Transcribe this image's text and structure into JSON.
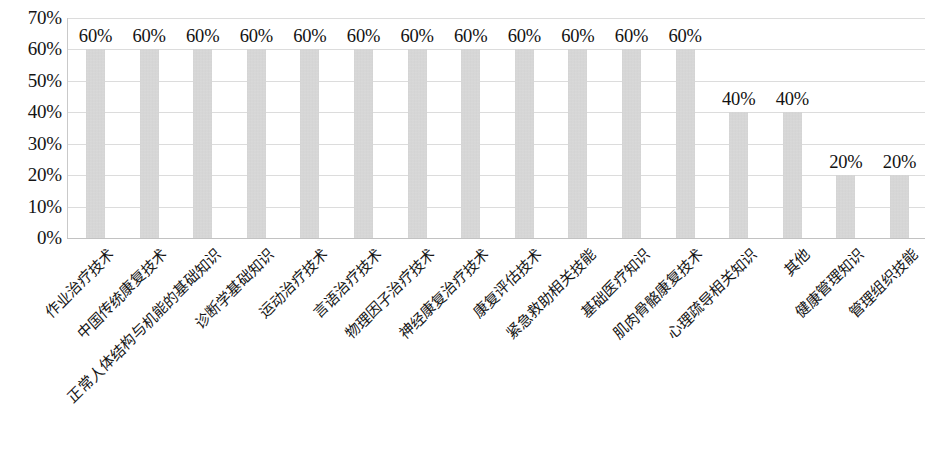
{
  "chart_data": {
    "type": "bar",
    "title": "",
    "subtitle": "",
    "xlabel": "",
    "ylabel": "",
    "ylim": [
      0,
      70
    ],
    "y_tick_labels": [
      "70%",
      "60%",
      "50%",
      "40%",
      "30%",
      "20%",
      "10%",
      "0%"
    ],
    "y_tick_values": [
      70,
      60,
      50,
      40,
      30,
      20,
      10,
      0
    ],
    "grid": true,
    "legend": "none",
    "value_suffix": "%",
    "categories": [
      "作业治疗技术",
      "中国传统康复技术",
      "正常人体结构与机能的基础知识",
      "诊断学基础知识",
      "运动治疗技术",
      "言语治疗技术",
      "物理因子治疗技术",
      "神经康复治疗技术",
      "康复评估技术",
      "紧急救助相关技能",
      "基础医疗知识",
      "肌肉骨骼康复技术",
      "心理疏导相关知识",
      "其他",
      "健康管理知识",
      "管理组织技能"
    ],
    "values": [
      60,
      60,
      60,
      60,
      60,
      60,
      60,
      60,
      60,
      60,
      60,
      60,
      40,
      40,
      20,
      20
    ],
    "data_labels": [
      "60%",
      "60%",
      "60%",
      "60%",
      "60%",
      "60%",
      "60%",
      "60%",
      "60%",
      "60%",
      "60%",
      "60%",
      "40%",
      "40%",
      "20%",
      "20%"
    ],
    "colors": {
      "bar_fill": "#d2d2d2",
      "gridline": "#dcdcdc",
      "axis": "#c9c9c9",
      "text": "#141414",
      "background": "#ffffff"
    }
  }
}
